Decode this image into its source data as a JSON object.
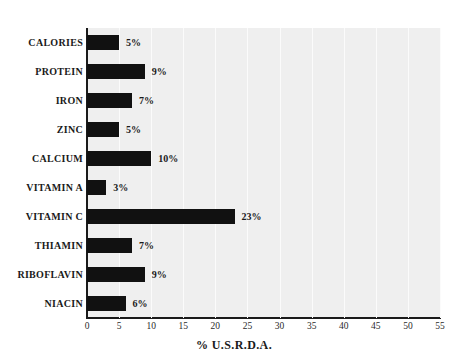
{
  "chart_data": {
    "type": "bar",
    "orientation": "horizontal",
    "title": "",
    "subtitle": "",
    "xlabel": "% U.S.R.D.A.",
    "ylabel": "",
    "xlim": [
      0,
      55
    ],
    "xticks": [
      0,
      5,
      10,
      15,
      20,
      25,
      30,
      35,
      40,
      45,
      50,
      55
    ],
    "xtick_labels": [
      "0",
      "5",
      "10",
      "15",
      "20",
      "25",
      "30",
      "35",
      "40",
      "45",
      "50",
      "55"
    ],
    "grid": true,
    "grid_axis": "x",
    "legend": false,
    "legend_position": "none",
    "categories": [
      "CALORIES",
      "PROTEIN",
      "IRON",
      "ZINC",
      "CALCIUM",
      "VITAMIN A",
      "VITAMIN C",
      "THIAMIN",
      "RIBOFLAVIN",
      "NIACIN"
    ],
    "values": [
      5,
      9,
      7,
      5,
      10,
      3,
      23,
      7,
      9,
      6
    ],
    "data_labels": [
      "5%",
      "9%",
      "7%",
      "5%",
      "10%",
      "3%",
      "23%",
      "7%",
      "9%",
      "6%"
    ],
    "bar_color": "#111111",
    "plot_background": "#efefef",
    "page_background": "#ffffff",
    "axis_color": "#1a1a1a",
    "gridline_color": "#fbfbfb"
  }
}
